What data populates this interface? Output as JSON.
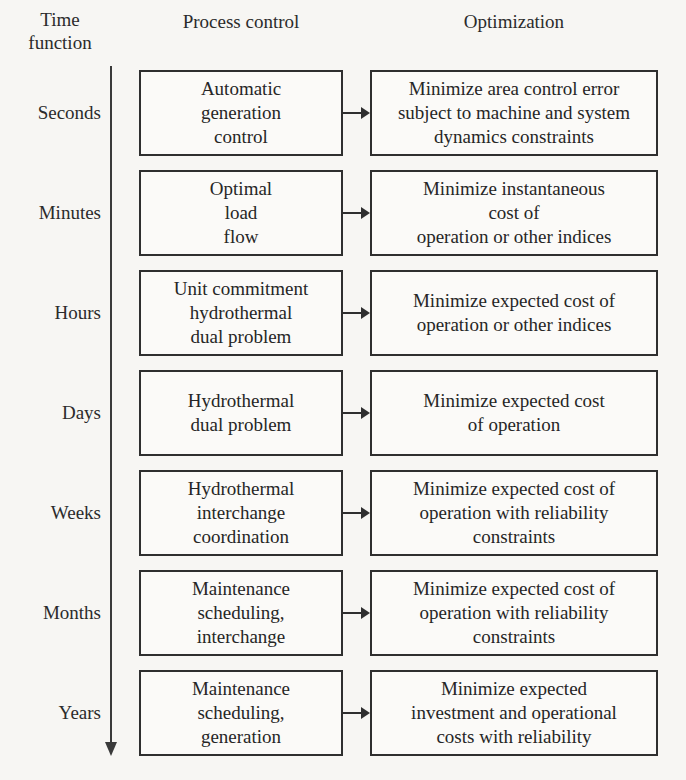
{
  "headers": {
    "time": "Time\nfunction",
    "process": "Process control",
    "optimization": "Optimization"
  },
  "timeline": {
    "axis_name": "downward-time-arrow",
    "direction": "downward"
  },
  "rows": [
    {
      "time": "Seconds",
      "process": "Automatic\ngeneration\ncontrol",
      "optimization": "Minimize area control error\nsubject to machine and system\ndynamics constraints"
    },
    {
      "time": "Minutes",
      "process": "Optimal\nload\nflow",
      "optimization": "Minimize instantaneous\ncost of\noperation or other indices"
    },
    {
      "time": "Hours",
      "process": "Unit commitment\nhydrothermal\ndual problem",
      "optimization": "Minimize expected cost of\noperation or other indices"
    },
    {
      "time": "Days",
      "process": "Hydrothermal\ndual problem",
      "optimization": "Minimize expected cost\nof operation"
    },
    {
      "time": "Weeks",
      "process": "Hydrothermal\ninterchange\ncoordination",
      "optimization": "Minimize expected cost of\noperation with reliability\nconstraints"
    },
    {
      "time": "Months",
      "process": "Maintenance\nscheduling,\ninterchange",
      "optimization": "Minimize expected cost of\noperation with reliability\nconstraints"
    },
    {
      "time": "Years",
      "process": "Maintenance\nscheduling,\ngeneration",
      "optimization": "Minimize expected\ninvestment and operational\ncosts with reliability"
    }
  ],
  "colors": {
    "background": "#f7f6f3",
    "box_border": "#2f2f2f",
    "box_fill": "#fbfaf8",
    "text": "#262626",
    "arrow": "#2f2f2f"
  }
}
